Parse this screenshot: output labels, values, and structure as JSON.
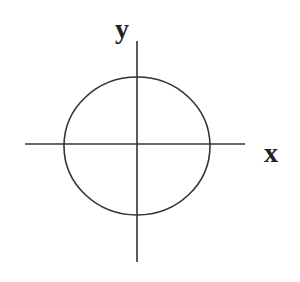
{
  "diagram": {
    "type": "coordinate-axes-with-circle",
    "labels": {
      "x_axis": "x",
      "y_axis": "y"
    },
    "colors": {
      "stroke": "#333333",
      "label": "#222222",
      "background": "#ffffff"
    },
    "geometry": {
      "origin": [
        137,
        144
      ],
      "x_axis": {
        "x1": 25,
        "x2": 245,
        "y": 144
      },
      "y_axis": {
        "x": 137,
        "y1": 41,
        "y2": 262
      },
      "circle": {
        "cx": 137,
        "cy": 146,
        "r": 70
      }
    }
  }
}
